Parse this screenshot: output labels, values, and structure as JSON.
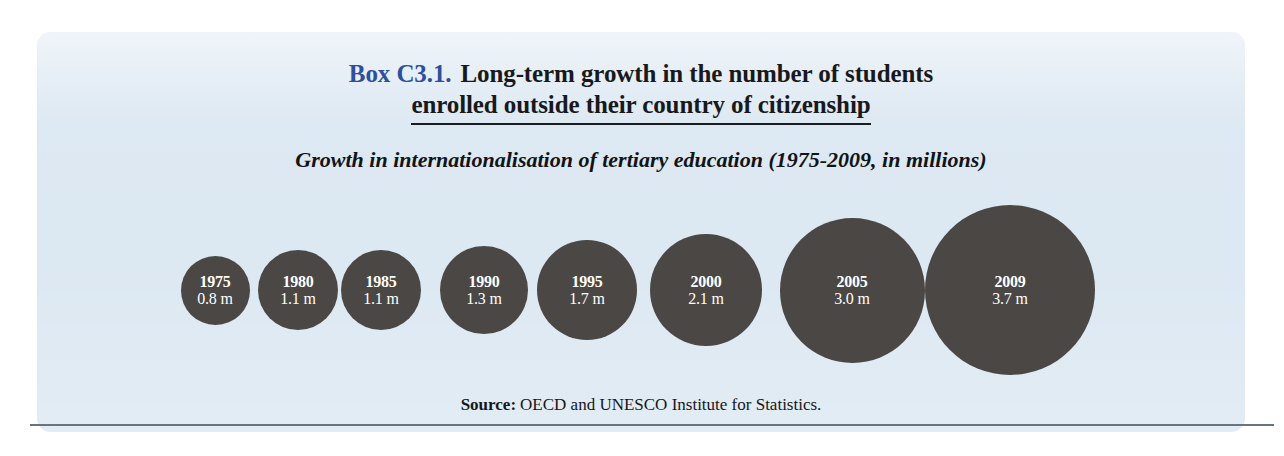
{
  "box": {
    "number": "Box C3.1.",
    "title_line_1": "Long-term growth in the number of students",
    "title_line_2": "enrolled outside their country of citizenship",
    "subtitle": "Growth in internationalisation of tertiary education (1975-2009, in millions)",
    "panel_color": "#dce8f2",
    "number_color": "#2d4f9e",
    "bubble_color": "#4a4745"
  },
  "source": {
    "label": "Source:",
    "text": "OECD and UNESCO Institute for Statistics."
  },
  "chart_data": {
    "type": "bar",
    "title": "Growth in internationalisation of tertiary education (1975-2009, in millions)",
    "xlabel": "",
    "ylabel": "Students enrolled outside their country of citizenship (millions)",
    "categories": [
      "1975",
      "1980",
      "1985",
      "1990",
      "1995",
      "2000",
      "2005",
      "2009"
    ],
    "values": [
      0.8,
      1.1,
      1.1,
      1.3,
      1.7,
      2.1,
      3.0,
      3.7
    ],
    "value_labels": [
      "0.8 m",
      "1.1 m",
      "1.1 m",
      "1.3 m",
      "1.7 m",
      "2.1 m",
      "3.0 m",
      "3.7 m"
    ],
    "ylim": [
      0,
      4
    ],
    "grid": false,
    "legend": "none",
    "note": "Rendered as proportional circles (bubble sizes scale with value); no axes drawn.",
    "points": [
      {
        "year": "1975",
        "value": 0.8,
        "label": "0.8 m",
        "diameter_px": 69,
        "center_x": 215,
        "center_y": 290
      },
      {
        "year": "1980",
        "value": 1.1,
        "label": "1.1 m",
        "diameter_px": 80,
        "center_x": 298,
        "center_y": 290
      },
      {
        "year": "1985",
        "value": 1.1,
        "label": "1.1 m",
        "diameter_px": 80,
        "center_x": 381,
        "center_y": 290
      },
      {
        "year": "1990",
        "value": 1.3,
        "label": "1.3 m",
        "diameter_px": 88,
        "center_x": 484,
        "center_y": 290
      },
      {
        "year": "1995",
        "value": 1.7,
        "label": "1.7 m",
        "diameter_px": 100,
        "center_x": 587,
        "center_y": 290
      },
      {
        "year": "2000",
        "value": 2.1,
        "label": "2.1 m",
        "diameter_px": 112,
        "center_x": 706,
        "center_y": 290
      },
      {
        "year": "2005",
        "value": 3.0,
        "label": "3.0 m",
        "diameter_px": 145,
        "center_x": 852,
        "center_y": 290
      },
      {
        "year": "2009",
        "value": 3.7,
        "label": "3.7 m",
        "diameter_px": 170,
        "center_x": 1010,
        "center_y": 290
      }
    ]
  }
}
